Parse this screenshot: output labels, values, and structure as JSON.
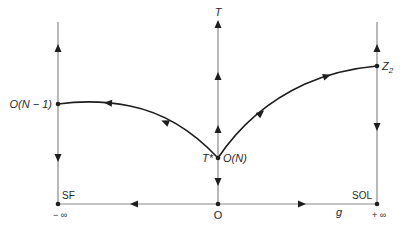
{
  "diagram": {
    "type": "flow-diagram",
    "axes": {
      "vertical_label": "T",
      "horizontal_label": "g",
      "origin_label": "O",
      "left_end_label": "− ∞",
      "right_end_label": "+ ∞"
    },
    "fixed_points": {
      "left_top": "O(N − 1)",
      "center": "O(N)",
      "center_left_label": "T*",
      "right_top": "Z",
      "right_top_subscript": "2",
      "left_bottom": "SF",
      "right_bottom": "SOL"
    },
    "colors": {
      "line": "#8a8a8a",
      "curve": "#1e1e1e",
      "text": "#2a2a2a",
      "background": "#ffffff"
    }
  }
}
